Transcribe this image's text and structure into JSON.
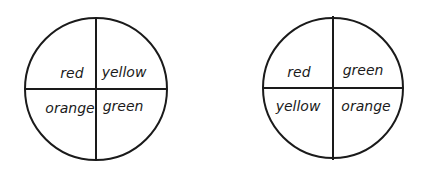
{
  "spinners": [
    {
      "name": "spinner-1",
      "cx": 96,
      "cy": 89,
      "r": 71,
      "sections": {
        "top_left": "red",
        "top_right": "yellow",
        "bottom_left": "orange",
        "bottom_right": "green"
      }
    },
    {
      "name": "spinner-2",
      "cx": 333,
      "cy": 88,
      "r": 70,
      "sections": {
        "top_left": "red",
        "top_right": "green",
        "bottom_left": "yellow",
        "bottom_right": "orange"
      }
    }
  ],
  "colors": {
    "line": "#1a1a1a",
    "background": "#ffffff"
  }
}
